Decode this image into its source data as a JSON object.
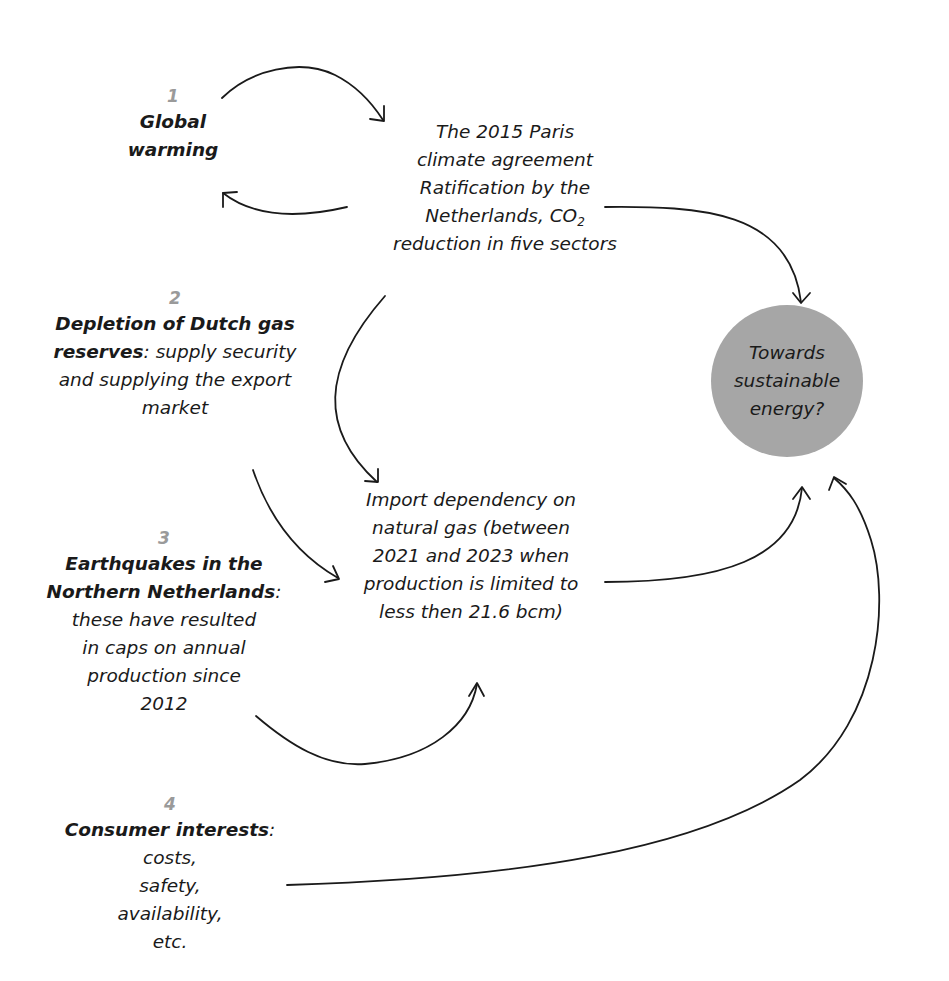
{
  "diagram": {
    "factors": [
      {
        "number": "1",
        "title": "Global warming",
        "description": ""
      },
      {
        "number": "2",
        "title": "Depletion of Dutch gas reserves",
        "title_suffix": ":",
        "description": "supply security and supplying the export market"
      },
      {
        "number": "3",
        "title": "Earthquakes in the Northern Netherlands",
        "title_suffix": ":",
        "description": "these have resulted in caps on annual production since 2012"
      },
      {
        "number": "4",
        "title": "Consumer interests",
        "title_suffix": ":",
        "description": "costs, safety, availability, etc."
      }
    ],
    "paris": {
      "line1": "The 2015 Paris",
      "line2": "climate agreement",
      "line3": "Ratification by the",
      "line4_prefix": "Netherlands, CO",
      "line4_sub": "2",
      "line5": "reduction in five sectors"
    },
    "import": {
      "line1": "Import dependency on",
      "line2": "natural gas (between",
      "line3": "2021 and 2023 when",
      "line4": "production is limited to",
      "line5": "less then 21.6 bcm)"
    },
    "goal": {
      "line1": "Towards",
      "line2": "sustainable",
      "line3": "energy?",
      "fill_color": "#a6a6a6"
    },
    "arrows": [
      {
        "from": "global-warming",
        "to": "paris-agreement"
      },
      {
        "from": "paris-agreement",
        "to": "global-warming"
      },
      {
        "from": "paris-agreement",
        "to": "sustainable-energy"
      },
      {
        "from": "paris-agreement",
        "to": "import-dependency"
      },
      {
        "from": "depletion",
        "to": "import-dependency"
      },
      {
        "from": "earthquakes",
        "to": "import-dependency"
      },
      {
        "from": "import-dependency",
        "to": "sustainable-energy"
      },
      {
        "from": "consumer-interests",
        "to": "sustainable-energy"
      }
    ]
  }
}
